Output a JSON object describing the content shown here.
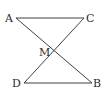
{
  "diagram": {
    "type": "geometry",
    "points": {
      "A": {
        "label": "A",
        "x": 16,
        "y": 18
      },
      "C": {
        "label": "C",
        "x": 84,
        "y": 18
      },
      "M": {
        "label": "M",
        "x": 54,
        "y": 53
      },
      "D": {
        "label": "D",
        "x": 24,
        "y": 83
      },
      "B": {
        "label": "B",
        "x": 92,
        "y": 83
      }
    },
    "segments": [
      {
        "from": "A",
        "to": "C"
      },
      {
        "from": "A",
        "to": "B"
      },
      {
        "from": "C",
        "to": "D"
      },
      {
        "from": "D",
        "to": "B"
      }
    ],
    "line_color": "#2a2a2a"
  }
}
